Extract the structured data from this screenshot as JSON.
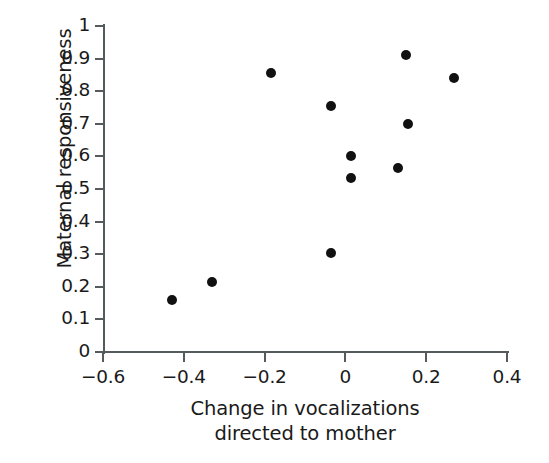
{
  "chart_data": {
    "type": "scatter",
    "title": "",
    "xlabel": "Change in vocalizations directed to mother",
    "xlabel_line1": "Change in vocalizations",
    "xlabel_line2": "directed to mother",
    "ylabel": "Maternal responsiveness",
    "xlim": [
      -0.6,
      0.4
    ],
    "ylim": [
      0,
      1
    ],
    "xticks": [
      -0.6,
      -0.4,
      -0.2,
      0,
      0.2,
      0.4
    ],
    "xtick_labels": [
      "-0.6",
      "-0.4",
      "-0.2",
      "0",
      "0.2",
      "0.4"
    ],
    "yticks": [
      0,
      0.1,
      0.2,
      0.3,
      0.4,
      0.5,
      0.6,
      0.7,
      0.8,
      0.9,
      1
    ],
    "ytick_labels": [
      "0",
      "0.1",
      "0.2",
      "0.3",
      "0.4",
      "0.5",
      "0.6",
      "0.7",
      "0.8",
      "0.9",
      "1"
    ],
    "grid": false,
    "legend": false,
    "marker": "filled-circle",
    "marker_color": "#111111",
    "axis_color": "#555a5c",
    "background": "#ffffff",
    "points": [
      {
        "x": -0.43,
        "y": 0.16
      },
      {
        "x": -0.33,
        "y": 0.215
      },
      {
        "x": -0.185,
        "y": 0.855
      },
      {
        "x": -0.035,
        "y": 0.305
      },
      {
        "x": -0.035,
        "y": 0.755
      },
      {
        "x": 0.015,
        "y": 0.6
      },
      {
        "x": 0.015,
        "y": 0.535
      },
      {
        "x": 0.13,
        "y": 0.565
      },
      {
        "x": 0.15,
        "y": 0.91
      },
      {
        "x": 0.155,
        "y": 0.7
      },
      {
        "x": 0.27,
        "y": 0.84
      }
    ]
  }
}
